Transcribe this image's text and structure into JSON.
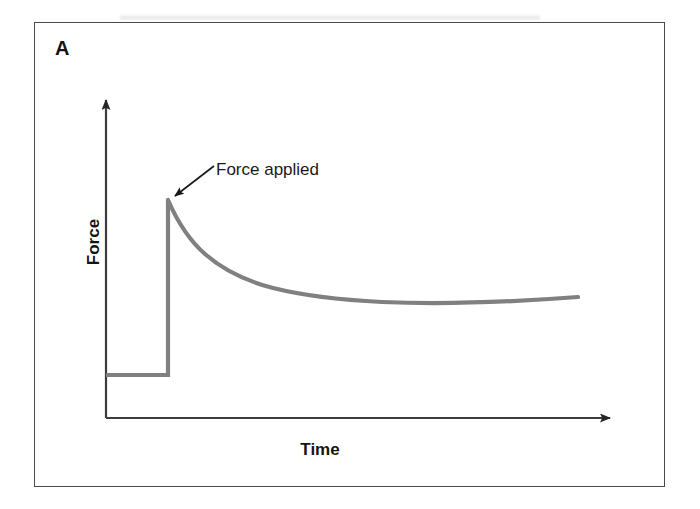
{
  "figure": {
    "panel_letter": "A",
    "annotation": "Force applied",
    "x_axis_label": "Time",
    "y_axis_label": "Force",
    "curve_color": "#808080",
    "axis_color": "#3d3d3d",
    "frame_color": "#4a4a4a",
    "text_color": "#141414",
    "background_color": "#ffffff"
  },
  "chart_data": {
    "type": "line",
    "title": "",
    "subtitle": "",
    "xlabel": "Time",
    "ylabel": "Force",
    "panel": "A",
    "grid": false,
    "legend": null,
    "axis_ticks": {
      "x": [],
      "y": []
    },
    "xlim": [
      0,
      10
    ],
    "ylim": [
      0,
      10
    ],
    "annotations": [
      {
        "text": "Force applied",
        "points_to": "curve-peak",
        "arrow": true,
        "target_xy": [
          1.35,
          5.9
        ],
        "label_xy": [
          2.2,
          7.3
        ]
      }
    ],
    "series": [
      {
        "name": "Force response (stress relaxation)",
        "description": "Flat baseline, instantaneous step rise when force is applied, then exponential decay to a plateau",
        "x": [
          0.0,
          0.4,
          0.8,
          1.2,
          1.3,
          1.32,
          1.34,
          1.45,
          1.6,
          1.8,
          2.05,
          2.35,
          2.7,
          3.1,
          3.55,
          4.05,
          4.6,
          5.2,
          5.85,
          6.55,
          7.3,
          8.1,
          8.95,
          9.85
        ],
        "y": [
          1.22,
          1.22,
          1.22,
          1.22,
          1.22,
          3.4,
          5.92,
          5.62,
          5.28,
          4.9,
          4.52,
          4.17,
          3.86,
          3.6,
          3.39,
          3.22,
          3.09,
          2.99,
          2.91,
          2.85,
          2.81,
          2.78,
          2.76,
          2.75
        ]
      }
    ]
  }
}
